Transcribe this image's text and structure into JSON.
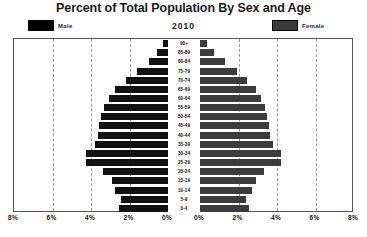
{
  "chart_data": {
    "type": "bar",
    "subtype": "population-pyramid",
    "title": "Percent of Total Population By Sex and Age",
    "year": "2010",
    "xlabel": "",
    "ylabel": "",
    "xlim": [
      -8,
      8
    ],
    "xtick_labels": [
      "8%",
      "6%",
      "4%",
      "2%",
      "0%",
      "0%",
      "2%",
      "4%",
      "6%",
      "8%"
    ],
    "xtick_values": [
      -8,
      -6,
      -4,
      -2,
      0,
      0,
      2,
      4,
      6,
      8
    ],
    "grid": true,
    "grid_style": "dashed-vertical",
    "legend": [
      {
        "name": "Male",
        "color": "#111111",
        "position": "top-left"
      },
      {
        "name": "Female",
        "color": "#3c3c3c",
        "position": "top-right"
      }
    ],
    "categories": [
      "90+",
      "85-89",
      "80-84",
      "75-79",
      "70-74",
      "65-69",
      "60-64",
      "55-59",
      "50-54",
      "45-49",
      "40-44",
      "35-39",
      "30-34",
      "25-29",
      "20-24",
      "15-19",
      "10-14",
      "5-9",
      "0-4"
    ],
    "series": [
      {
        "name": "Male",
        "color": "#111111",
        "side": "left",
        "values": [
          0.25,
          0.55,
          1.0,
          1.6,
          2.2,
          2.75,
          3.05,
          3.35,
          3.5,
          3.6,
          3.65,
          3.8,
          4.25,
          4.25,
          3.4,
          2.9,
          2.75,
          2.45,
          2.55
        ]
      },
      {
        "name": "Female",
        "color": "#3c3c3c",
        "side": "right",
        "values": [
          0.35,
          0.75,
          1.3,
          1.9,
          2.45,
          2.9,
          3.15,
          3.4,
          3.5,
          3.6,
          3.65,
          3.8,
          4.2,
          4.2,
          3.35,
          2.9,
          2.7,
          2.4,
          2.55
        ]
      }
    ]
  }
}
